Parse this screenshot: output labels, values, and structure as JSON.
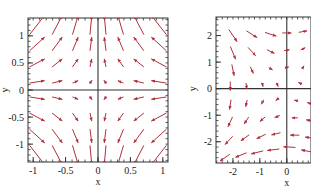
{
  "chart_data": [
    {
      "type": "quiver",
      "title": "",
      "xlabel": "x",
      "ylabel": "y",
      "xlim": [
        -1.08,
        1.08
      ],
      "ylim": [
        -1.33,
        1.33
      ],
      "xticks": [
        -1,
        -0.5,
        0,
        0.5,
        1
      ],
      "xtick_labels": [
        "-1",
        "-0.5",
        "0",
        "0.5",
        "1"
      ],
      "yticks": [
        -1,
        -0.5,
        0,
        0.5,
        1
      ],
      "ytick_labels": [
        "-1",
        "-0.5",
        "0",
        "0.5",
        "1"
      ],
      "grid": false,
      "zero_lines": true,
      "arrow_color": "#b0303c",
      "field": "saddle: (u, v) = (-x, y)",
      "grid_x": [
        -0.94,
        -0.63,
        -0.35,
        -0.11,
        0.11,
        0.35,
        0.63,
        0.94
      ],
      "grid_y": [
        1.2,
        0.85,
        0.5,
        0.15,
        -0.15,
        -0.5,
        -0.85,
        -1.2
      ]
    },
    {
      "type": "quiver",
      "title": "",
      "xlabel": "x",
      "ylabel": "y",
      "xlim": [
        -2.63,
        0.9
      ],
      "ylim": [
        -2.8,
        2.7
      ],
      "xticks": [
        -2,
        -1,
        0
      ],
      "xtick_labels": [
        "-2",
        "-1",
        "0"
      ],
      "yticks": [
        -2,
        -1,
        0,
        1,
        2
      ],
      "ytick_labels": [
        "-2",
        "-1",
        "0",
        "1",
        "2"
      ],
      "grid": false,
      "zero_lines": true,
      "arrow_color": "#b0303c",
      "clipped_right": true,
      "arrows": [
        {
          "x": -2.0,
          "y": 2.0,
          "u": 0.55,
          "v": -0.8
        },
        {
          "x": -1.3,
          "y": 2.05,
          "u": 0.7,
          "v": -0.45
        },
        {
          "x": -0.6,
          "y": 2.05,
          "u": 0.75,
          "v": -0.25
        },
        {
          "x": 0.0,
          "y": 2.1,
          "u": 0.6,
          "v": 0.0
        },
        {
          "x": 0.6,
          "y": 2.15,
          "u": 0.55,
          "v": 0.1
        },
        {
          "x": -2.0,
          "y": 1.35,
          "u": 0.35,
          "v": -0.85
        },
        {
          "x": -1.3,
          "y": 1.4,
          "u": 0.5,
          "v": -0.55
        },
        {
          "x": -0.6,
          "y": 1.4,
          "u": 0.5,
          "v": -0.25
        },
        {
          "x": 0.0,
          "y": 1.45,
          "u": 0.35,
          "v": 0.05
        },
        {
          "x": 0.6,
          "y": 1.5,
          "u": 0.3,
          "v": 0.15
        },
        {
          "x": -2.0,
          "y": 0.7,
          "u": 0.15,
          "v": -0.75
        },
        {
          "x": -1.3,
          "y": 0.7,
          "u": 0.2,
          "v": -0.45
        },
        {
          "x": -0.6,
          "y": 0.75,
          "u": 0.25,
          "v": -0.15
        },
        {
          "x": 0.0,
          "y": 0.8,
          "u": 0.15,
          "v": 0.05
        },
        {
          "x": 0.6,
          "y": 0.8,
          "u": 0.1,
          "v": 0.15
        },
        {
          "x": -2.1,
          "y": 0.1,
          "u": 0.0,
          "v": -0.6
        },
        {
          "x": -1.5,
          "y": 0.1,
          "u": 0.05,
          "v": -0.4
        },
        {
          "x": -0.9,
          "y": 0.15,
          "u": 0.05,
          "v": -0.2
        },
        {
          "x": -0.35,
          "y": 0.15,
          "u": 0.05,
          "v": -0.12
        },
        {
          "x": 0.5,
          "y": 0.2,
          "u": -0.1,
          "v": 0.05
        },
        {
          "x": -2.1,
          "y": -0.6,
          "u": -0.1,
          "v": -0.65
        },
        {
          "x": -1.5,
          "y": -0.55,
          "u": -0.1,
          "v": -0.45
        },
        {
          "x": -0.9,
          "y": -0.5,
          "u": -0.15,
          "v": -0.3
        },
        {
          "x": -0.35,
          "y": -0.4,
          "u": -0.15,
          "v": -0.12
        },
        {
          "x": 0.35,
          "y": -0.45,
          "u": -0.2,
          "v": 0.05
        },
        {
          "x": 0.85,
          "y": -0.55,
          "u": -0.3,
          "v": 0.1
        },
        {
          "x": -2.1,
          "y": -1.25,
          "u": -0.3,
          "v": -0.65
        },
        {
          "x": -1.5,
          "y": -1.2,
          "u": -0.3,
          "v": -0.45
        },
        {
          "x": -0.9,
          "y": -1.15,
          "u": -0.35,
          "v": -0.3
        },
        {
          "x": -0.35,
          "y": -1.05,
          "u": -0.35,
          "v": -0.15
        },
        {
          "x": 0.3,
          "y": -1.1,
          "u": -0.4,
          "v": 0.0
        },
        {
          "x": 0.85,
          "y": -1.2,
          "u": -0.45,
          "v": 0.1
        },
        {
          "x": -2.15,
          "y": -1.95,
          "u": -0.5,
          "v": -0.55
        },
        {
          "x": -1.55,
          "y": -1.85,
          "u": -0.55,
          "v": -0.4
        },
        {
          "x": -0.95,
          "y": -1.8,
          "u": -0.6,
          "v": -0.3
        },
        {
          "x": -0.4,
          "y": -1.7,
          "u": -0.6,
          "v": -0.15
        },
        {
          "x": 0.3,
          "y": -1.75,
          "u": -0.6,
          "v": 0.0
        },
        {
          "x": 0.85,
          "y": -1.85,
          "u": -0.6,
          "v": 0.1
        },
        {
          "x": -2.3,
          "y": -2.6,
          "u": -0.65,
          "v": -0.45
        },
        {
          "x": -1.7,
          "y": -2.5,
          "u": -0.75,
          "v": -0.3
        },
        {
          "x": -1.1,
          "y": -2.4,
          "u": -0.8,
          "v": -0.2
        },
        {
          "x": -0.5,
          "y": -2.3,
          "u": -0.8,
          "v": -0.1
        },
        {
          "x": 0.1,
          "y": -2.2,
          "u": -0.8,
          "v": 0.05
        },
        {
          "x": 0.75,
          "y": -2.35,
          "u": -0.75,
          "v": 0.15
        }
      ]
    }
  ],
  "panels": [
    {
      "frame": {
        "left": 28,
        "top": 18,
        "right": 168,
        "bottom": 162
      }
    },
    {
      "frame": {
        "left": 216,
        "top": 17,
        "right": 311,
        "bottom": 163
      }
    }
  ]
}
